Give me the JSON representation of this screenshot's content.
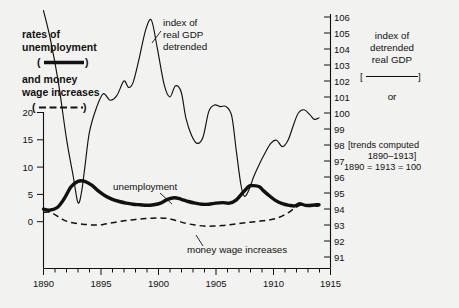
{
  "chart_data": {
    "type": "line",
    "title": "",
    "xlabel": "",
    "left_axis": {
      "label": "rates of unemployment and money wage increases (per cent)",
      "ticks": [
        0,
        5,
        10,
        15,
        20
      ],
      "ylim": [
        -4,
        20
      ]
    },
    "right_axis": {
      "label": "index of detrended real GDP",
      "ticks": [
        91,
        92,
        93,
        94,
        95,
        96,
        97,
        98,
        99,
        100,
        101,
        102,
        103,
        104,
        105,
        106
      ],
      "ylim": [
        90.4,
        106.4
      ]
    },
    "x": {
      "ticks": [
        1890,
        1895,
        1900,
        1905,
        1910,
        1915
      ],
      "minor_step": 1,
      "xlim": [
        1890,
        1915
      ]
    },
    "grid": false,
    "legend_position": "outside-left-and-right",
    "series": [
      {
        "name": "index of real GDP detrended",
        "axis": "right",
        "style": "thin-solid",
        "x": [
          1890.0,
          1890.6,
          1891.3,
          1892.0,
          1892.6,
          1893.0,
          1893.3,
          1893.6,
          1894.0,
          1894.6,
          1895.2,
          1895.8,
          1896.4,
          1897.0,
          1897.4,
          1897.8,
          1898.3,
          1898.9,
          1899.4,
          1899.9,
          1900.5,
          1901.0,
          1901.5,
          1902.0,
          1902.4,
          1902.9,
          1903.4,
          1903.9,
          1904.4,
          1904.9,
          1905.4,
          1905.9,
          1906.4,
          1906.8,
          1907.2,
          1907.5,
          1907.9,
          1908.3,
          1908.8,
          1909.3,
          1909.8,
          1910.3,
          1910.8,
          1911.3,
          1911.8,
          1912.2,
          1912.7,
          1913.2,
          1913.6,
          1914.0
        ],
        "y": [
          106.4,
          104.6,
          101.9,
          98.4,
          96.0,
          94.4,
          95.0,
          96.6,
          98.8,
          100.3,
          101.2,
          100.8,
          101.1,
          102.0,
          101.6,
          101.9,
          103.3,
          105.2,
          105.8,
          104.1,
          101.8,
          101.0,
          101.7,
          101.3,
          99.7,
          98.6,
          98.1,
          98.5,
          100.1,
          100.5,
          100.4,
          100.4,
          99.8,
          97.6,
          95.5,
          94.8,
          95.2,
          96.0,
          96.8,
          97.5,
          98.1,
          98.3,
          97.9,
          98.3,
          99.3,
          100.0,
          100.2,
          99.9,
          99.6,
          99.7
        ]
      },
      {
        "name": "unemployment",
        "axis": "left",
        "style": "thick-solid",
        "x": [
          1890.0,
          1890.5,
          1891.2,
          1891.8,
          1892.4,
          1893.0,
          1893.6,
          1894.2,
          1894.8,
          1895.4,
          1896.0,
          1896.6,
          1897.2,
          1897.8,
          1898.4,
          1899.0,
          1899.6,
          1900.2,
          1900.8,
          1901.4,
          1902.0,
          1902.6,
          1903.2,
          1903.8,
          1904.4,
          1905.0,
          1905.6,
          1906.2,
          1906.8,
          1907.4,
          1907.9,
          1908.3,
          1908.8,
          1909.2,
          1909.7,
          1910.2,
          1910.8,
          1911.4,
          1911.9,
          1912.3,
          1912.8,
          1913.3,
          1913.8,
          1914.0
        ],
        "y": [
          2.3,
          2.1,
          2.6,
          4.2,
          6.4,
          7.4,
          7.4,
          6.7,
          5.6,
          4.7,
          4.1,
          3.7,
          3.4,
          3.2,
          3.1,
          3.0,
          3.1,
          3.4,
          4.1,
          4.4,
          4.1,
          3.7,
          3.4,
          3.2,
          3.2,
          3.4,
          3.5,
          3.4,
          4.0,
          5.4,
          6.5,
          6.6,
          6.4,
          5.6,
          4.7,
          3.9,
          3.3,
          3.0,
          2.9,
          3.3,
          3.0,
          3.0,
          3.1,
          3.1
        ]
      },
      {
        "name": "money wage increases",
        "axis": "left",
        "style": "dashed",
        "x": [
          1890.0,
          1890.6,
          1891.3,
          1892.0,
          1892.8,
          1893.6,
          1894.4,
          1895.2,
          1896.0,
          1896.8,
          1897.6,
          1898.4,
          1899.2,
          1900.0,
          1900.8,
          1901.6,
          1902.4,
          1903.2,
          1904.0,
          1904.8,
          1905.6,
          1906.4,
          1907.2,
          1908.0,
          1908.8,
          1909.6,
          1910.4,
          1911.2,
          1911.9,
          1912.5,
          1913.1,
          1913.6,
          1914.0
        ],
        "y": [
          1.7,
          1.7,
          0.9,
          0.1,
          -0.3,
          -0.5,
          -0.6,
          -0.5,
          -0.2,
          0.1,
          0.3,
          0.5,
          0.6,
          0.7,
          0.6,
          0.2,
          -0.3,
          -0.6,
          -0.8,
          -0.8,
          -0.7,
          -0.5,
          -0.3,
          -0.1,
          0.1,
          0.3,
          0.7,
          1.5,
          2.5,
          3.1,
          2.8,
          2.8,
          2.9
        ]
      }
    ],
    "annotations": [
      {
        "name": "gdp-callout",
        "text_lines": [
          "index of",
          "real GDP",
          "detrended"
        ],
        "x": 1895.8,
        "y_right": 105.2
      },
      {
        "name": "unemployment-callout",
        "text": "unemployment",
        "x": 1901.4,
        "y_left": 4.4
      },
      {
        "name": "wage-callout",
        "text": "money wage increases",
        "x": 1906.0,
        "y_left": -0.6
      }
    ]
  },
  "left_legend": {
    "line1": "rates of",
    "line2": "unemployment",
    "solid_key_open": "(",
    "solid_key_close": ")",
    "line3": "and money",
    "line4": "wage increases",
    "dash_key_open": "(",
    "dash_key_close": ")"
  },
  "right_legend": {
    "line1": "index of",
    "line2": "detrended",
    "line3": "real GDP",
    "key_open": "[",
    "key_close": "]",
    "or": "or",
    "note1": "[trends computed",
    "note2": "1890–1913]",
    "note3": "1890 = 1913 = 100"
  },
  "left_ticks": [
    "20",
    "15",
    "10",
    "5",
    "0"
  ],
  "right_ticks": [
    "106",
    "105",
    "104",
    "103",
    "102",
    "101",
    "100",
    "99",
    "98",
    "97",
    "96",
    "95",
    "94",
    "93",
    "92",
    "91"
  ],
  "x_ticks": [
    "1890",
    "1895",
    "1900",
    "1905",
    "1910",
    "1915"
  ],
  "annotation_text": {
    "gdp_l1": "index of",
    "gdp_l2": "real GDP",
    "gdp_l3": "detrended",
    "unemployment": "unemployment",
    "wages": "money wage increases"
  },
  "colors": {
    "background": "#f2f2f0",
    "ink": "#111111"
  }
}
